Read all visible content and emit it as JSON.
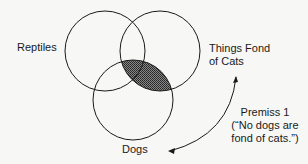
{
  "diagram": {
    "type": "venn",
    "sets": [
      {
        "name": "Reptiles",
        "label": "Reptiles"
      },
      {
        "name": "Things Fond of Cats",
        "label_line1": "Things Fond",
        "label_line2": "of Cats"
      },
      {
        "name": "Dogs",
        "label": "Dogs"
      }
    ],
    "shaded_region": "Dogs ∩ Things Fond of Cats",
    "annotation": {
      "line1": "Premiss 1",
      "line2": "(“No dogs are",
      "line3": "fond of cats.”)"
    },
    "colors": {
      "stroke": "#1a1a1a",
      "shade": "#555555",
      "background": "#f7f7f5"
    }
  }
}
